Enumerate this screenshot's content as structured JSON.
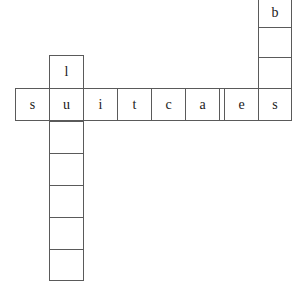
{
  "puzzle": {
    "title": "Crossword Grid",
    "background_color": "#ffffff",
    "grid_line_color": "#5a5a5a",
    "letter_color": "#1a1a1a",
    "canvas": {
      "width": 301,
      "height": 288
    },
    "cell_size": {
      "width": 34,
      "height": 33
    },
    "entries": [
      {
        "id": "across-1",
        "direction": "across",
        "answer": "suitcases",
        "length": 9,
        "letters": [
          "s",
          "u",
          "i",
          "t",
          "c",
          "a",
          "s",
          "e",
          "s"
        ]
      },
      {
        "id": "down-1",
        "direction": "down",
        "length": 7,
        "letters": [
          "l",
          "u",
          "",
          "",
          "",
          "",
          ""
        ],
        "intersects": "across-1 at index 1"
      },
      {
        "id": "down-2",
        "direction": "down",
        "length": 4,
        "letters": [
          "b",
          "",
          "",
          "s"
        ],
        "intersects": "across-1 at index 8"
      }
    ],
    "cells": [
      {
        "name": "cell-across-0",
        "letter": "s",
        "x": 15,
        "y": 88,
        "w": 35,
        "h": 33,
        "empty": false
      },
      {
        "name": "cell-across-1",
        "letter": "u",
        "x": 49,
        "y": 88,
        "w": 35,
        "h": 33,
        "empty": false
      },
      {
        "name": "cell-across-2",
        "letter": "i",
        "x": 83,
        "y": 88,
        "w": 35,
        "h": 33,
        "empty": false
      },
      {
        "name": "cell-across-3",
        "letter": "t",
        "x": 117,
        "y": 88,
        "w": 35,
        "h": 33,
        "empty": false
      },
      {
        "name": "cell-across-4",
        "letter": "c",
        "x": 151,
        "y": 88,
        "w": 35,
        "h": 33,
        "empty": false
      },
      {
        "name": "cell-across-5",
        "letter": "a",
        "x": 185,
        "y": 88,
        "w": 35,
        "h": 33,
        "empty": false
      },
      {
        "name": "cell-across-6",
        "letter": "s",
        "x": 219,
        "y": 88,
        "w": 35,
        "h": 33,
        "empty": false
      },
      {
        "name": "cell-across-7",
        "letter": "e",
        "x": 224,
        "y": 88,
        "w": 35,
        "h": 33,
        "empty": false
      },
      {
        "name": "cell-across-8",
        "letter": "s",
        "x": 258,
        "y": 88,
        "w": 34,
        "h": 33,
        "empty": false
      },
      {
        "name": "cell-down1-0",
        "letter": "l",
        "x": 49,
        "y": 55,
        "w": 35,
        "h": 34,
        "empty": false
      },
      {
        "name": "cell-down1-2",
        "letter": "",
        "x": 49,
        "y": 121,
        "w": 35,
        "h": 33,
        "empty": true
      },
      {
        "name": "cell-down1-3",
        "letter": "",
        "x": 49,
        "y": 153,
        "w": 35,
        "h": 33,
        "empty": true
      },
      {
        "name": "cell-down1-4",
        "letter": "",
        "x": 49,
        "y": 185,
        "w": 35,
        "h": 33,
        "empty": true
      },
      {
        "name": "cell-down1-5",
        "letter": "",
        "x": 49,
        "y": 217,
        "w": 35,
        "h": 33,
        "empty": true
      },
      {
        "name": "cell-down1-6",
        "letter": "",
        "x": 49,
        "y": 249,
        "w": 35,
        "h": 32,
        "empty": true
      },
      {
        "name": "cell-down2-0",
        "letter": "b",
        "x": 258,
        "y": -3,
        "w": 34,
        "h": 31,
        "empty": false
      },
      {
        "name": "cell-down2-1",
        "letter": "",
        "x": 258,
        "y": 27,
        "w": 34,
        "h": 31,
        "empty": true
      },
      {
        "name": "cell-down2-2",
        "letter": "",
        "x": 258,
        "y": 57,
        "w": 34,
        "h": 32,
        "empty": true
      }
    ]
  }
}
